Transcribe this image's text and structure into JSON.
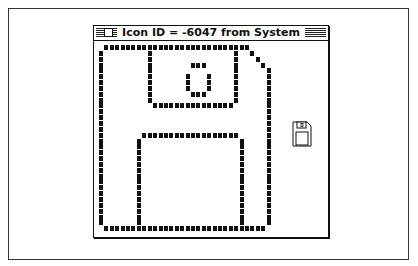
{
  "window": {
    "title": "Icon  ID = -6047 from System",
    "close_box": "close-box"
  },
  "icon": {
    "name": "floppy-disk",
    "grid_size": 32,
    "rows": [
      "01111111111111111111111111110000",
      "10000000010000000000000001001000",
      "10000000010000000000000001000100",
      "10000000010000000111000001000010",
      "10000000010000000000000001000001",
      "10000000010000001000100001000001",
      "10000000010000001000100001000001",
      "10000000010000001000100001000001",
      "10000000010000000111000001000001",
      "10000000010000000000000001000001",
      "10000000001111111111111110000001",
      "10000000000000000000000000000001",
      "10000000000000000000000000000001",
      "10000000000000000000000000000001",
      "10000000000000000000000000000001",
      "10000000111111111111111111000001",
      "10000001000000000000000000100001",
      "10000001000000000000000000100001",
      "10000001000000000000000000100001",
      "10000001000000000000000000100001",
      "10000001000000000000000000100001",
      "10000001000000000000000000100001",
      "10000001000000000000000000100001",
      "10000001000000000000000000100001",
      "10000001000000000000000000100001",
      "10000001000000000000000000100001",
      "10000001000000000000000000100001",
      "10000001000000000000000000100001",
      "10000001000000000000000000100001",
      "10000001000000000000000000100001",
      "10000001000000000000000000100001",
      "01111111111111111111111111111110"
    ]
  },
  "preview": {
    "name": "floppy-disk-actual-size"
  }
}
